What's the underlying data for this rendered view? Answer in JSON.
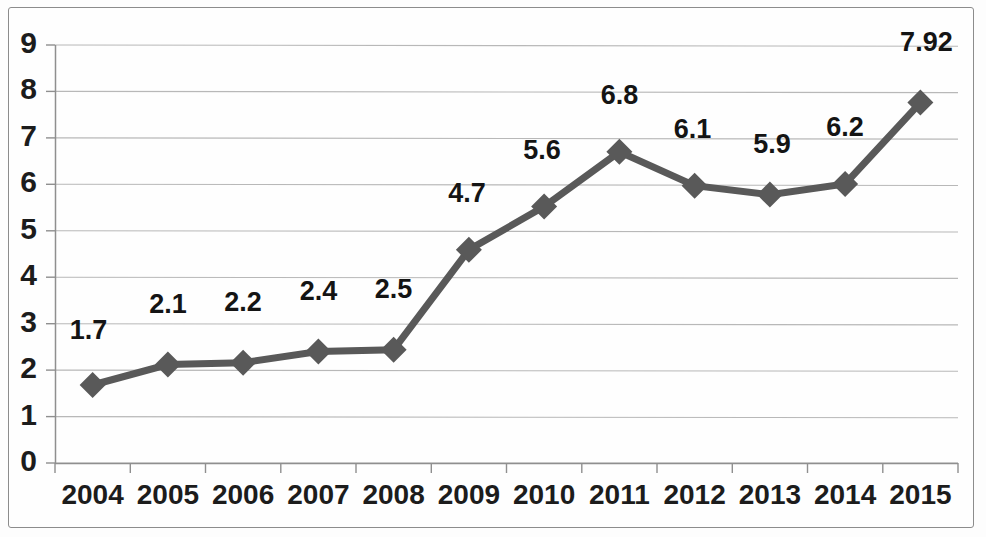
{
  "chart_data": {
    "type": "line",
    "title": "",
    "subtitle": "",
    "xlabel": "",
    "ylabel": "",
    "categories": [
      "2004",
      "2005",
      "2006",
      "2007",
      "2008",
      "2009",
      "2010",
      "2011",
      "2012",
      "2013",
      "2014",
      "2015"
    ],
    "values": [
      1.7,
      2.1,
      2.2,
      2.4,
      2.5,
      4.7,
      5.6,
      6.8,
      6.1,
      5.9,
      6.2,
      7.92
    ],
    "plotted_values": [
      1.68,
      2.12,
      2.16,
      2.4,
      2.44,
      4.59,
      5.52,
      6.7,
      5.97,
      5.78,
      6.01,
      7.76
    ],
    "data_labels": [
      "1.7",
      "2.1",
      "2.2",
      "2.4",
      "2.5",
      "4.7",
      "5.6",
      "6.8",
      "6.1",
      "5.9",
      "6.2",
      "7.92"
    ],
    "series": [
      {
        "name": "",
        "values": [
          1.7,
          2.1,
          2.2,
          2.4,
          2.5,
          4.7,
          5.6,
          6.8,
          6.1,
          5.9,
          6.2,
          7.92
        ],
        "color": "#595959",
        "marker": "diamond"
      }
    ],
    "ylim": [
      0,
      9
    ],
    "ytick_labels": [
      "0",
      "1",
      "2",
      "3",
      "4",
      "5",
      "6",
      "7",
      "8",
      "9"
    ],
    "ytick_values": [
      0,
      1,
      2,
      3,
      4,
      5,
      6,
      7,
      8,
      9
    ],
    "grid": true,
    "grid_axis": "y",
    "legend": false,
    "legend_position": "none",
    "data_labels_shown": true,
    "colors": {
      "series": "#595959",
      "gridline": "#b8b8b8",
      "axis": "#8f8f8f",
      "text": "#1c1c1c",
      "background": "#fefefe",
      "frame": "#8c8c8c"
    }
  }
}
